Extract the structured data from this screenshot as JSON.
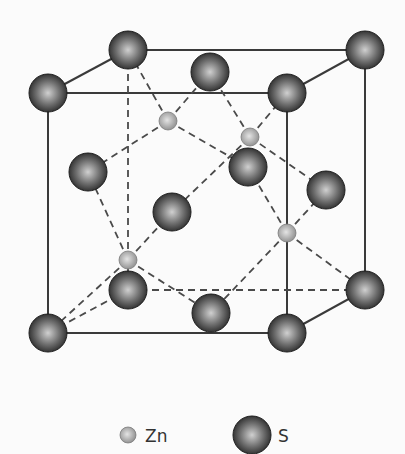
{
  "diagram": {
    "cube": {
      "front": {
        "tl": [
          48,
          93
        ],
        "tr": [
          287,
          93
        ],
        "br": [
          287,
          333
        ],
        "bl": [
          48,
          333
        ]
      },
      "back": {
        "tl": [
          128,
          50
        ],
        "tr": [
          365,
          50
        ],
        "br": [
          365,
          290
        ],
        "bl": [
          128,
          290
        ]
      }
    },
    "s_atoms": [
      {
        "id": "corner-back-top-left",
        "x": 128,
        "y": 50
      },
      {
        "id": "corner-back-top-right",
        "x": 365,
        "y": 50
      },
      {
        "id": "corner-front-top-left",
        "x": 48,
        "y": 93
      },
      {
        "id": "corner-front-top-right",
        "x": 287,
        "y": 93
      },
      {
        "id": "corner-back-bottom-right",
        "x": 365,
        "y": 290
      },
      {
        "id": "corner-back-bottom-left",
        "x": 128,
        "y": 290
      },
      {
        "id": "corner-front-bottom-left",
        "x": 48,
        "y": 333
      },
      {
        "id": "corner-front-bottom-right",
        "x": 287,
        "y": 333
      },
      {
        "id": "face-top",
        "x": 210,
        "y": 72
      },
      {
        "id": "face-back",
        "x": 248,
        "y": 167
      },
      {
        "id": "face-left",
        "x": 88,
        "y": 172
      },
      {
        "id": "face-right",
        "x": 326,
        "y": 190
      },
      {
        "id": "face-front",
        "x": 172,
        "y": 212
      },
      {
        "id": "face-bottom",
        "x": 211,
        "y": 313
      }
    ],
    "zn_atoms": [
      {
        "id": "zn-1",
        "x": 168,
        "y": 121
      },
      {
        "id": "zn-2",
        "x": 250,
        "y": 137
      },
      {
        "id": "zn-3",
        "x": 128,
        "y": 260
      },
      {
        "id": "zn-4",
        "x": 287,
        "y": 233
      }
    ],
    "colors": {
      "s_dark": "#2e2e2e",
      "s_light": "#c8c8c8",
      "zn_dark": "#8a8a8a",
      "zn_light": "#d8d8d8",
      "line": "#3a3a3a",
      "background": "#fbfbfb"
    }
  },
  "legend": {
    "zn_label": "Zn",
    "s_label": "S"
  }
}
